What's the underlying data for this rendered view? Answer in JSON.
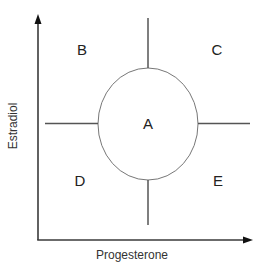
{
  "diagram": {
    "title": "",
    "axes": {
      "x_label": "Progesterone",
      "y_label": "Estradiol"
    },
    "regions": {
      "A": "A",
      "B": "B",
      "C": "C",
      "D": "D",
      "E": "E"
    },
    "colors": {
      "axis": "#3a3a3a",
      "lines": "#555555",
      "ellipse": "#777777",
      "text": "#222222"
    }
  }
}
